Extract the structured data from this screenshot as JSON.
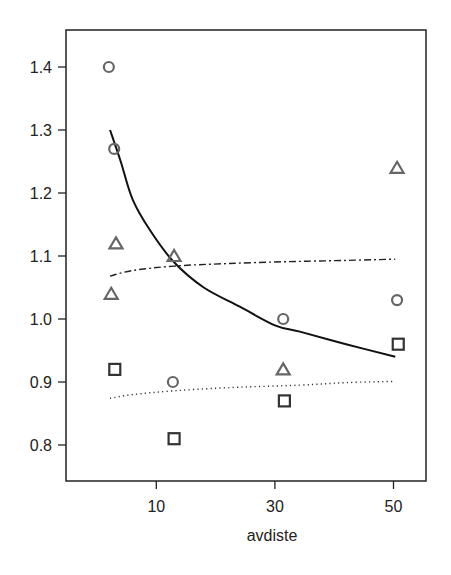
{
  "chart_data": {
    "type": "scatter",
    "title": "",
    "xlabel": "avdiste",
    "ylabel": "",
    "xlim": [
      -3,
      55.5
    ],
    "ylim": [
      0.74,
      1.455
    ],
    "x_ticks": [
      10,
      30,
      50
    ],
    "x_tick_labels": [
      "10",
      "30",
      "50"
    ],
    "y_ticks": [
      0.8,
      0.9,
      1.0,
      1.1,
      1.2,
      1.3,
      1.4
    ],
    "y_tick_labels": [
      "0.8",
      "0.9",
      "1.0",
      "1.1",
      "1.2",
      "1.3",
      "1.4"
    ],
    "grid": false,
    "legend": null,
    "series": [
      {
        "name": "circles",
        "marker": "circle",
        "color": "#666666",
        "points": [
          {
            "x": 2.0,
            "y": 1.4
          },
          {
            "x": 2.9,
            "y": 1.27
          },
          {
            "x": 12.8,
            "y": 0.9
          },
          {
            "x": 31.4,
            "y": 1.0
          },
          {
            "x": 50.6,
            "y": 1.03
          }
        ]
      },
      {
        "name": "triangles",
        "marker": "triangle",
        "color": "#666666",
        "points": [
          {
            "x": 3.2,
            "y": 1.12
          },
          {
            "x": 2.4,
            "y": 1.04
          },
          {
            "x": 13.0,
            "y": 1.1
          },
          {
            "x": 31.4,
            "y": 0.92
          },
          {
            "x": 50.6,
            "y": 1.24
          }
        ]
      },
      {
        "name": "squares",
        "marker": "square",
        "color": "#333333",
        "points": [
          {
            "x": 3.0,
            "y": 0.92
          },
          {
            "x": 13.0,
            "y": 0.81
          },
          {
            "x": 31.6,
            "y": 0.87
          },
          {
            "x": 50.8,
            "y": 0.96
          }
        ]
      }
    ],
    "fitted_lines": [
      {
        "name": "solid-curve",
        "style": "solid",
        "color": "#111111",
        "points": [
          {
            "x": 2.2,
            "y": 1.3
          },
          {
            "x": 4.0,
            "y": 1.25
          },
          {
            "x": 6.0,
            "y": 1.19
          },
          {
            "x": 9.0,
            "y": 1.14
          },
          {
            "x": 13.0,
            "y": 1.09
          },
          {
            "x": 18.0,
            "y": 1.05
          },
          {
            "x": 24.0,
            "y": 1.02
          },
          {
            "x": 30.0,
            "y": 0.99
          },
          {
            "x": 34.2,
            "y": 0.98
          },
          {
            "x": 42.0,
            "y": 0.96
          },
          {
            "x": 50.3,
            "y": 0.94
          }
        ]
      },
      {
        "name": "dash-dot-curve",
        "style": "dashdot",
        "color": "#222222",
        "points": [
          {
            "x": 2.2,
            "y": 1.068
          },
          {
            "x": 6.0,
            "y": 1.077
          },
          {
            "x": 13.0,
            "y": 1.084
          },
          {
            "x": 22.0,
            "y": 1.088
          },
          {
            "x": 32.0,
            "y": 1.091
          },
          {
            "x": 42.0,
            "y": 1.093
          },
          {
            "x": 50.3,
            "y": 1.095
          }
        ]
      },
      {
        "name": "dotted-curve",
        "style": "dotted",
        "color": "#333333",
        "points": [
          {
            "x": 2.2,
            "y": 0.874
          },
          {
            "x": 6.0,
            "y": 0.88
          },
          {
            "x": 13.0,
            "y": 0.886
          },
          {
            "x": 22.0,
            "y": 0.891
          },
          {
            "x": 34.2,
            "y": 0.895
          },
          {
            "x": 42.0,
            "y": 0.899
          },
          {
            "x": 50.3,
            "y": 0.901
          }
        ]
      }
    ]
  },
  "layout": {
    "plot_box": {
      "left": 66,
      "top": 30,
      "right": 426,
      "bottom": 481
    },
    "x_map": {
      "origin_px": 97,
      "px_per_unit": 5.93
    },
    "y_map": {
      "ref_value": 1.0,
      "ref_px": 319,
      "px_per_unit": 630
    }
  }
}
